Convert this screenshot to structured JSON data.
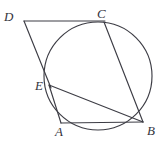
{
  "figure": {
    "kind": "circle-geometry-diagram",
    "width": 166,
    "height": 148,
    "background_color": "#ffffff",
    "stroke_color": "#3d3d45",
    "label_color": "#34343c",
    "circle": {
      "center_x": 98,
      "center_y": 76,
      "radius": 54
    },
    "points": [
      {
        "id": "D",
        "label": "D",
        "x": 24,
        "y": 21,
        "on_circle": false,
        "label_x": 4,
        "label_y": 10
      },
      {
        "id": "C",
        "label": "C",
        "x": 104,
        "y": 21,
        "on_circle": true,
        "label_x": 97,
        "label_y": 7
      },
      {
        "id": "E",
        "label": "E",
        "x": 49,
        "y": 85,
        "on_circle": true,
        "label_x": 35,
        "label_y": 79
      },
      {
        "id": "A",
        "label": "A",
        "x": 61,
        "y": 123,
        "on_circle": true,
        "label_x": 55,
        "label_y": 125
      },
      {
        "id": "B",
        "label": "B",
        "x": 143,
        "y": 122,
        "on_circle": true,
        "label_x": 147,
        "label_y": 124
      }
    ],
    "segments": [
      {
        "id": "DC",
        "from": "D",
        "to": "C",
        "x1": 24,
        "y1": 21,
        "x2": 105,
        "y2": 21
      },
      {
        "id": "DE",
        "from": "D",
        "to": "E",
        "x1": 24,
        "y1": 21,
        "x2": 51,
        "y2": 88
      },
      {
        "id": "CB",
        "from": "C",
        "to": "B",
        "x1": 104,
        "y1": 22,
        "x2": 143,
        "y2": 122
      },
      {
        "id": "EB",
        "from": "E",
        "to": "B",
        "x1": 49,
        "y1": 85,
        "x2": 143,
        "y2": 122
      },
      {
        "id": "EA",
        "from": "E",
        "to": "A",
        "x1": 49,
        "y1": 85,
        "x2": 61,
        "y2": 123
      },
      {
        "id": "AB",
        "from": "A",
        "to": "B",
        "x1": 61,
        "y1": 123,
        "x2": 143,
        "y2": 122
      }
    ]
  }
}
